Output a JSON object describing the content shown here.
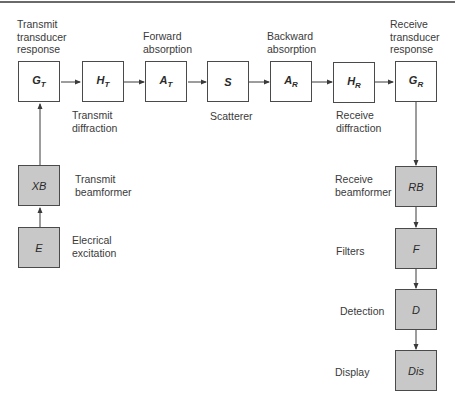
{
  "diagram": {
    "type": "block-diagram",
    "top_row": [
      {
        "id": "GT",
        "symbol": "G",
        "subscript": "T",
        "label": "Transmit\ntransducer\nresponse",
        "label_pos": "above"
      },
      {
        "id": "HT",
        "symbol": "H",
        "subscript": "T",
        "label": "Transmit\ndiffraction",
        "label_pos": "below"
      },
      {
        "id": "AT",
        "symbol": "A",
        "subscript": "T",
        "label": "Forward\nabsorption",
        "label_pos": "above"
      },
      {
        "id": "S",
        "symbol": "S",
        "subscript": "",
        "label": "Scatterer",
        "label_pos": "below"
      },
      {
        "id": "AR",
        "symbol": "A",
        "subscript": "R",
        "label": "Backward\nabsorption",
        "label_pos": "above"
      },
      {
        "id": "HR",
        "symbol": "H",
        "subscript": "R",
        "label": "Receive\ndiffraction",
        "label_pos": "below"
      },
      {
        "id": "GR",
        "symbol": "G",
        "subscript": "R",
        "label": "Receive\ntransducer\nresponse",
        "label_pos": "above"
      }
    ],
    "left_column": [
      {
        "id": "XB",
        "symbol": "XB",
        "label": "Transmit\nbeamformer"
      },
      {
        "id": "E",
        "symbol": "E",
        "label": "Elecrical\nexcitation"
      }
    ],
    "right_column": [
      {
        "id": "RB",
        "symbol": "RB",
        "label": "Receive\nbeamformer"
      },
      {
        "id": "F",
        "symbol": "F",
        "label": "Filters"
      },
      {
        "id": "D",
        "symbol": "D",
        "label": "Detection"
      },
      {
        "id": "Dis",
        "symbol": "Dis",
        "label": "Display"
      }
    ],
    "edges": [
      [
        "E",
        "XB"
      ],
      [
        "XB",
        "GT"
      ],
      [
        "GT",
        "HT"
      ],
      [
        "HT",
        "AT"
      ],
      [
        "AT",
        "S"
      ],
      [
        "S",
        "AR"
      ],
      [
        "AR",
        "HR"
      ],
      [
        "HR",
        "GR"
      ],
      [
        "GR",
        "RB"
      ],
      [
        "RB",
        "F"
      ],
      [
        "F",
        "D"
      ],
      [
        "D",
        "Dis"
      ]
    ],
    "colors": {
      "white_box": "#ffffff",
      "gray_box": "#c8c8c8",
      "stroke": "#4a4a4a"
    }
  }
}
